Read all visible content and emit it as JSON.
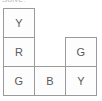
{
  "caption": {
    "text": "Solve:"
  },
  "puzzle": {
    "rows": 3,
    "cols": 3,
    "colors": {
      "Y": "#d9c22a",
      "R": "#c0392b",
      "G": "#27914a",
      "B": "#2d63c8"
    },
    "cells": [
      {
        "row": 0,
        "col": 0,
        "label": "Y",
        "filled": true
      },
      {
        "row": 0,
        "col": 1,
        "label": "",
        "filled": false
      },
      {
        "row": 0,
        "col": 2,
        "label": "",
        "filled": false
      },
      {
        "row": 1,
        "col": 0,
        "label": "R",
        "filled": true
      },
      {
        "row": 1,
        "col": 1,
        "label": "",
        "filled": false
      },
      {
        "row": 1,
        "col": 2,
        "label": "G",
        "filled": true
      },
      {
        "row": 2,
        "col": 0,
        "label": "G",
        "filled": true
      },
      {
        "row": 2,
        "col": 1,
        "label": "B",
        "filled": true
      },
      {
        "row": 2,
        "col": 2,
        "label": "Y",
        "filled": true
      }
    ]
  }
}
